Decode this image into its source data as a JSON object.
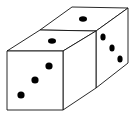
{
  "figure": {
    "dice": [
      {
        "name": "front-die",
        "top_face_pips": 1,
        "front_face_pips": 3
      },
      {
        "name": "back-die",
        "top_face_pips": 1,
        "right_face_pips": 3
      }
    ],
    "colors": {
      "stroke": "#000000",
      "fill": "#ffffff",
      "pip": "#000000"
    }
  }
}
